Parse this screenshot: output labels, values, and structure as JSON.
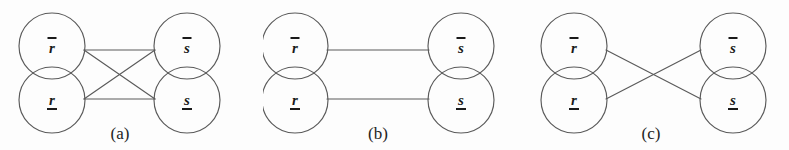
{
  "figure": {
    "background_color": "#fdfdfd",
    "stroke_color": "#5a5a5a",
    "text_color": "#1a1a1a",
    "panels": [
      {
        "id": "a",
        "caption": "(a)",
        "nodes": {
          "top_left": "r",
          "bottom_left": "r",
          "top_right": "s",
          "bottom_right": "s"
        },
        "node_decorations": {
          "top_left": "overbar",
          "bottom_left": "underline",
          "top_right": "overbar",
          "bottom_right": "underline"
        },
        "edges": [
          "top_left-top_right",
          "bottom_left-bottom_right",
          "top_left-bottom_right",
          "bottom_left-top_right"
        ],
        "edge_count": 4
      },
      {
        "id": "b",
        "caption": "(b)",
        "nodes": {
          "top_left": "r",
          "bottom_left": "r",
          "top_right": "s",
          "bottom_right": "s"
        },
        "node_decorations": {
          "top_left": "overbar",
          "bottom_left": "underline",
          "top_right": "overbar",
          "bottom_right": "underline"
        },
        "edges": [
          "top_left-top_right",
          "bottom_left-bottom_right"
        ],
        "edge_count": 2
      },
      {
        "id": "c",
        "caption": "(c)",
        "nodes": {
          "top_left": "r",
          "bottom_left": "r",
          "top_right": "s",
          "bottom_right": "s"
        },
        "node_decorations": {
          "top_left": "overbar",
          "bottom_left": "underline",
          "top_right": "overbar",
          "bottom_right": "underline"
        },
        "edges": [
          "top_left-bottom_right",
          "bottom_left-top_right"
        ],
        "edge_count": 2
      }
    ]
  }
}
